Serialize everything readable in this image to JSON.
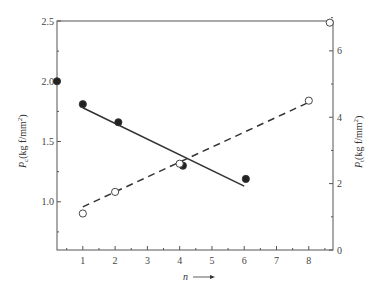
{
  "chart_data": {
    "type": "scatter",
    "title": "",
    "xlabel": "n",
    "xlabel_arrow": "→",
    "ylabel_left": "Pc (kg f/mm²)",
    "ylabel_right": "Pt (kg f/mm²)",
    "xlim": [
      0.2,
      8.75
    ],
    "ylim_left": [
      0.6,
      2.5
    ],
    "ylim_right": [
      0,
      6.9
    ],
    "x_ticks": [
      "1",
      "2",
      "3",
      "4",
      "5",
      "6",
      "7",
      "8"
    ],
    "y_left_ticks": [
      "1.0",
      "1.5",
      "2.0",
      "2.5"
    ],
    "y_right_ticks": [
      "0",
      "2",
      "4",
      "6"
    ],
    "grid": false,
    "series": [
      {
        "name": "Pc",
        "axis": "left",
        "marker": "filled-circle",
        "points": [
          {
            "x": 0.2,
            "y": 2.0
          },
          {
            "x": 1.0,
            "y": 1.81
          },
          {
            "x": 2.1,
            "y": 1.66
          },
          {
            "x": 4.1,
            "y": 1.3
          },
          {
            "x": 6.05,
            "y": 1.19
          }
        ],
        "fit_line": {
          "style": "solid",
          "from": {
            "x": 1.0,
            "y": 1.78
          },
          "to": {
            "x": 6.0,
            "y": 1.13
          }
        }
      },
      {
        "name": "Pt",
        "axis": "right",
        "marker": "open-circle",
        "points": [
          {
            "x": 1.0,
            "y": 1.1
          },
          {
            "x": 2.0,
            "y": 1.75
          },
          {
            "x": 4.0,
            "y": 2.6
          },
          {
            "x": 8.0,
            "y": 4.5
          },
          {
            "x": 8.65,
            "y": 6.85
          }
        ],
        "fit_line": {
          "style": "dashed",
          "from": {
            "x": 1.0,
            "y": 1.3
          },
          "to": {
            "x": 8.0,
            "y": 4.45
          }
        }
      }
    ]
  },
  "labels": {
    "x_axis": "n",
    "left_axis_main": "P",
    "left_axis_sub": "c",
    "left_axis_units": "(kg f/mm",
    "right_axis_main": "P",
    "right_axis_sub": "t",
    "right_axis_units": "(kg f/mm",
    "sup": "2",
    "close": ")"
  }
}
